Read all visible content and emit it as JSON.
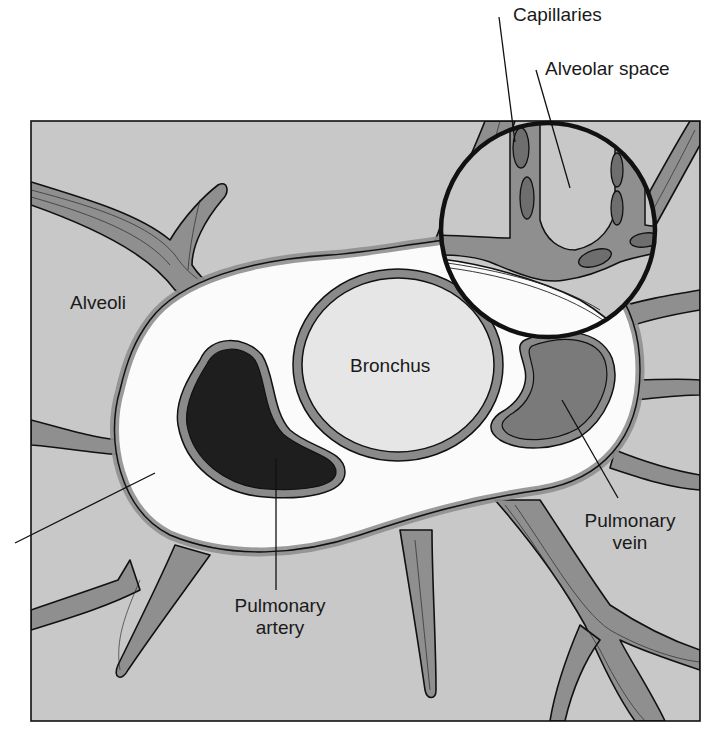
{
  "diagram": {
    "type": "anatomical-illustration",
    "labels": {
      "capillaries": "Capillaries",
      "alveolar_space": "Alveolar space",
      "alveoli": "Alveoli",
      "bronchus": "Bronchus",
      "pulmonary_artery_line1": "Pulmonary",
      "pulmonary_artery_line2": "artery",
      "pulmonary_vein_line1": "Pulmonary",
      "pulmonary_vein_line2": "vein"
    },
    "unlabeled_pointer": "leader line at left pointing to connective tissue sheath (no label text visible)",
    "inset": "circular magnified view showing capillaries within alveolar walls",
    "colors": {
      "alveolar_background": "#c8c8c8",
      "septum_tissue": "#8f8f8f",
      "connective_sheath": "#fbfbfb",
      "bronchus_lumen": "#e6e6e6",
      "bronchus_wall": "#8a8a8a",
      "pulmonary_artery": "#1e1e1e",
      "pulmonary_vein": "#7a7a7a",
      "capillary_cell": "#6e6e6e",
      "outline": "#111111"
    }
  }
}
